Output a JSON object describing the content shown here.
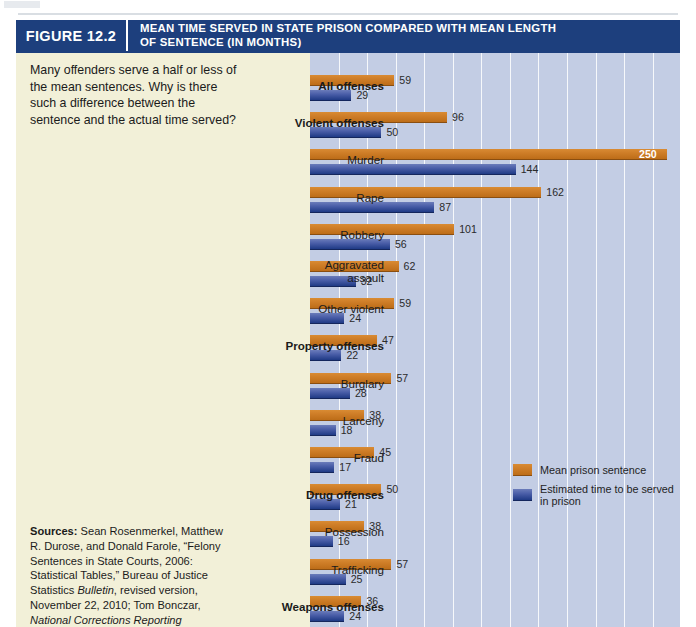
{
  "figure": {
    "number": "FIGURE 12.2",
    "title_line1": "MEAN TIME SERVED IN STATE PRISON COMPARED WITH MEAN LENGTH",
    "title_line2": "OF SENTENCE (IN MONTHS)",
    "header_bg": "#1d3f7d"
  },
  "prompt": "Many offenders serve a half or less of the mean sentences. Why is there such a difference between the sentence and the actual time served?",
  "sources": {
    "label": "Sources:",
    "text_1": " Sean Rosenmerkel, Matthew R. Durose, and Donald Farole, “Felony Sentences in State Courts, 2006: Statistical Tables,” Bureau of Justice Statistics ",
    "italic_1": "Bulletin",
    "text_2": ", revised version, November 22, 2010; Tom Bonczar, ",
    "italic_2": "National Corrections Reporting"
  },
  "chart_data": {
    "type": "bar",
    "orientation": "horizontal",
    "title": "MEAN TIME SERVED IN STATE PRISON COMPARED WITH MEAN LENGTH OF SENTENCE (IN MONTHS)",
    "xlabel": "",
    "ylabel": "",
    "xlim": [
      0,
      260
    ],
    "grid": true,
    "grid_interval": 20,
    "legend_position": "inside-bottom-right",
    "units": "months",
    "categories": [
      "All offenses",
      "Violent offenses",
      "Murder",
      "Rape",
      "Robbery",
      "Aggravated assault",
      "Other violent",
      "Property offenses",
      "Burglary",
      "Larceny",
      "Fraud",
      "Drug offenses",
      "Possession",
      "Trafficking",
      "Weapons offenses"
    ],
    "category_bold": [
      true,
      true,
      false,
      false,
      false,
      false,
      false,
      true,
      false,
      false,
      false,
      true,
      false,
      false,
      true
    ],
    "series": [
      {
        "name": "Mean prison sentence",
        "color": "#cf7e28",
        "values": [
          59,
          96,
          250,
          162,
          101,
          62,
          59,
          47,
          57,
          38,
          45,
          50,
          38,
          57,
          36
        ]
      },
      {
        "name": "Estimated time to be served in prison",
        "color": "#2f4a9b",
        "values": [
          29,
          50,
          144,
          87,
          56,
          32,
          24,
          22,
          28,
          18,
          17,
          21,
          16,
          25,
          24
        ]
      }
    ]
  },
  "legend": [
    {
      "label": "Mean prison sentence",
      "swatch": "sentence"
    },
    {
      "label": "Estimated time to be served in prison",
      "swatch": "served"
    }
  ]
}
